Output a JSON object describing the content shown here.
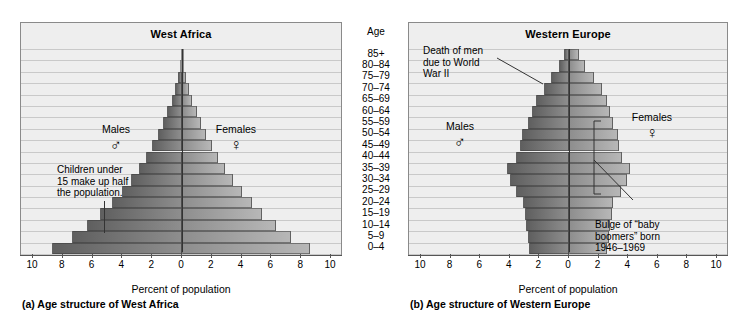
{
  "figure": {
    "axis_caption": "Percent of population",
    "age_header": "Age"
  },
  "panels": {
    "a": {
      "title": "West Africa",
      "caption": "(a) Age structure of West Africa",
      "males_label": "Males",
      "females_label": "Females",
      "male_glyph": "♂",
      "female_glyph": "♀",
      "note": "Children under\n15 make up half\nthe population."
    },
    "b": {
      "title": "Western Europe",
      "caption": "(b) Age structure of Western Europe",
      "males_label": "Males",
      "females_label": "Females",
      "male_glyph": "♂",
      "female_glyph": "♀",
      "note_war": "Death of men\ndue to World\nWar II",
      "note_boom": "Bulge of “baby\nboomers” born\n1946–1969"
    }
  },
  "colors": {
    "male_bar_dark": "#5f5f5f",
    "male_bar_light": "#8e8e8e",
    "female_bar_dark": "#8e8e8e",
    "female_bar_light": "#b7b7b7",
    "panel_background": "#eeeeee",
    "gridline": "#c9c9c9",
    "axis": "#333333"
  },
  "chart_data": [
    {
      "type": "bar",
      "subtype": "population-pyramid",
      "title": "West Africa",
      "caption": "(a) Age structure of West Africa",
      "xlabel": "Percent of population",
      "ylabel": "Age",
      "xlim": [
        -10,
        10
      ],
      "xticks": [
        10,
        8,
        6,
        4,
        2,
        0,
        2,
        4,
        6,
        8,
        10
      ],
      "grid": true,
      "legend_position": "in-plot",
      "categories": [
        "0–4",
        "5–9",
        "10–14",
        "15–19",
        "20–24",
        "25–29",
        "30–34",
        "35–39",
        "40–44",
        "45–49",
        "50–54",
        "55–59",
        "60–64",
        "65–69",
        "70–74",
        "75–79",
        "80–84",
        "85+"
      ],
      "series": [
        {
          "name": "Males",
          "values": [
            8.7,
            7.4,
            6.4,
            5.5,
            4.7,
            4.0,
            3.4,
            2.9,
            2.4,
            2.0,
            1.6,
            1.3,
            1.0,
            0.7,
            0.5,
            0.3,
            0.15,
            0.07
          ]
        },
        {
          "name": "Females",
          "values": [
            8.6,
            7.3,
            6.3,
            5.4,
            4.7,
            4.0,
            3.4,
            2.9,
            2.4,
            2.0,
            1.6,
            1.3,
            1.0,
            0.7,
            0.5,
            0.3,
            0.15,
            0.07
          ]
        }
      ],
      "annotations": [
        {
          "text": "Children under 15 make up half the population.",
          "target": "0–4 / 5–9 / 10–14 bands"
        }
      ]
    },
    {
      "type": "bar",
      "subtype": "population-pyramid",
      "title": "Western Europe",
      "caption": "(b) Age structure of Western Europe",
      "xlabel": "Percent of population",
      "ylabel": "Age",
      "xlim": [
        -10,
        10
      ],
      "xticks": [
        10,
        8,
        6,
        4,
        2,
        0,
        2,
        4,
        6,
        8,
        10
      ],
      "grid": true,
      "legend_position": "in-plot",
      "categories": [
        "0–4",
        "5–9",
        "10–14",
        "15–19",
        "20–24",
        "25–29",
        "30–34",
        "35–39",
        "40–44",
        "45–49",
        "50–54",
        "55–59",
        "60–64",
        "65–69",
        "70–74",
        "75–79",
        "80–84",
        "85+"
      ],
      "series": [
        {
          "name": "Males",
          "values": [
            2.7,
            2.8,
            2.9,
            3.0,
            3.1,
            3.6,
            4.0,
            4.2,
            3.6,
            3.3,
            3.2,
            2.8,
            2.5,
            2.2,
            1.7,
            1.2,
            0.7,
            0.35
          ]
        },
        {
          "name": "Females",
          "values": [
            2.6,
            2.7,
            2.8,
            2.9,
            3.0,
            3.5,
            3.9,
            4.1,
            3.6,
            3.4,
            3.3,
            3.0,
            2.8,
            2.6,
            2.2,
            1.7,
            1.1,
            0.65
          ]
        }
      ],
      "annotations": [
        {
          "text": "Death of men due to World War II",
          "target": "male 55–59 / 60–64 bands"
        },
        {
          "text": "Bulge of “baby boomers” born 1946–1969",
          "target": "25–29 through 45–49 bands"
        }
      ]
    }
  ]
}
